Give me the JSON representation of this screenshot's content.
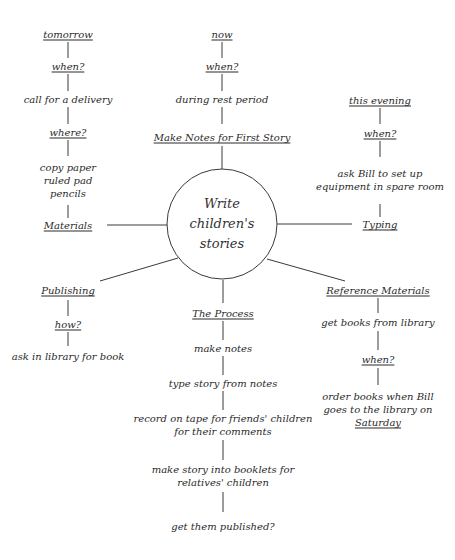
{
  "central": {
    "label_line1": "Write",
    "label_line2": "children's",
    "label_line3": "stories"
  },
  "branches": {
    "materials": {
      "title": "Materials",
      "chain": [
        "tomorrow",
        "when?",
        "call for a delivery",
        "where?"
      ],
      "items": [
        "copy paper",
        "ruled pad",
        "pencils"
      ]
    },
    "first_story": {
      "title": "Make Notes for First Story",
      "chain": [
        "now",
        "when?",
        "during rest period"
      ]
    },
    "typing": {
      "title": "Typing",
      "chain": [
        "this evening",
        "when?"
      ],
      "detail_line1": "ask Bill to set up",
      "detail_line2": "equipment in spare room"
    },
    "publishing": {
      "title": "Publishing",
      "chain": [
        "how?",
        "ask in library for book"
      ]
    },
    "process": {
      "title": "The Process",
      "steps": [
        "make notes",
        "type story from notes",
        "record on tape for friends' children",
        "for their comments",
        "make story into booklets for",
        "relatives' children",
        "get them published?"
      ]
    },
    "reference": {
      "title": "Reference Materials",
      "chain": [
        "get books from library",
        "when?"
      ],
      "detail_line1": "order books when Bill",
      "detail_line2": "goes to the library on",
      "detail_line3": "Saturday"
    }
  }
}
